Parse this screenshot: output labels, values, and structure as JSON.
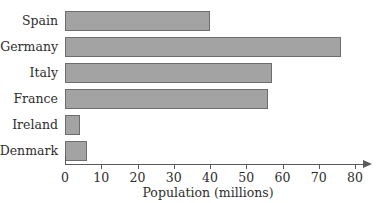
{
  "chart_data": {
    "type": "bar",
    "orientation": "horizontal",
    "title": "",
    "xlabel": "Population (millions)",
    "ylabel": "",
    "categories": [
      "Spain",
      "Germany",
      "Italy",
      "France",
      "Ireland",
      "Denmark"
    ],
    "values": [
      40,
      76,
      57,
      56,
      4,
      6
    ],
    "xlim": [
      0,
      80
    ],
    "xticks": [
      0,
      10,
      20,
      30,
      40,
      50,
      60,
      70,
      80
    ],
    "xtick_labels": [
      "0",
      "10",
      "20",
      "30",
      "40",
      "50",
      "60",
      "70",
      "80"
    ],
    "grid": false,
    "legend": null,
    "bar_fill_color": "#a3a3a3",
    "bar_border_color": "#6d6d6d",
    "axis_color": "#595959",
    "background_color": "#ffffff",
    "axis_has_arrow": true
  }
}
